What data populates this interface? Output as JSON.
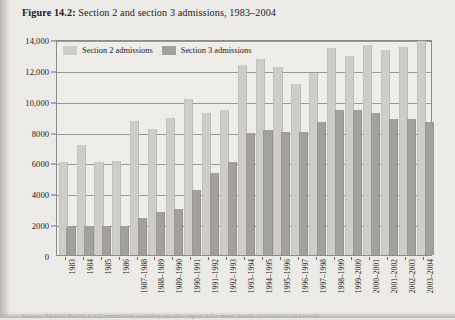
{
  "figure": {
    "label": "Figure 14.2:",
    "title": " Section 2 and section 3 admissions, 1983–2004",
    "source_note": "Source: Mental Health Act Commission, website; see also report 4 for more details on statistics and trends"
  },
  "legend": {
    "position": "top-left-inside",
    "items": [
      {
        "label": "Section 2 admissions",
        "color": "#cfcdc8",
        "key": "section2"
      },
      {
        "label": "Section 3 admissions",
        "color": "#a3a19c",
        "key": "section3"
      }
    ]
  },
  "y_axis": {
    "title": "",
    "min": 0,
    "max": 14000,
    "step": 2000,
    "ticks": [
      "0",
      "2000",
      "4000",
      "6000",
      "8000",
      "10,000",
      "12,000",
      "14,000"
    ],
    "tick_values": [
      0,
      2000,
      4000,
      6000,
      8000,
      10000,
      12000,
      14000
    ],
    "grid": true
  },
  "x_axis": {
    "title": "",
    "rotated_labels": true
  },
  "chart_data": {
    "type": "bar",
    "title": "Section 2 and section 3 admissions, 1983–2004",
    "xlabel": "",
    "ylabel": "",
    "ylim": [
      0,
      14000
    ],
    "grid": true,
    "legend_position": "top-left-inside",
    "categories": [
      "1983",
      "1984",
      "1985",
      "1986",
      "1987–1988",
      "1988–1989",
      "1989–1990",
      "1990–1991",
      "1991–1992",
      "1992–1993",
      "1993–1994",
      "1994–1995",
      "1995–1996",
      "1996–1997",
      "1997–1998",
      "1998–1999",
      "1999–2000",
      "2000–2001",
      "2001–2002",
      "2002–2003",
      "2003–2004"
    ],
    "series": [
      {
        "name": "Section 2 admissions",
        "color": "#cfcdc8",
        "values": [
          6000,
          7100,
          6000,
          6100,
          8700,
          8200,
          8900,
          10100,
          9200,
          9400,
          12300,
          12700,
          12200,
          11100,
          11800,
          13400,
          12900,
          13600,
          13300,
          13500,
          13900
        ]
      },
      {
        "name": "Section 3 admissions",
        "color": "#a3a19c",
        "values": [
          1800,
          1900,
          1900,
          1900,
          2400,
          2800,
          3000,
          4200,
          5300,
          6000,
          7900,
          8100,
          8000,
          8000,
          8600,
          9400,
          9400,
          9200,
          8800,
          8800,
          8600
        ]
      }
    ]
  }
}
